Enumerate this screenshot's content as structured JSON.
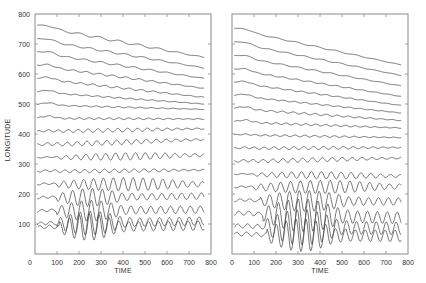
{
  "chart_data": [
    {
      "type": "line",
      "panel": "left",
      "title": "",
      "xlabel": "TIME",
      "ylabel": "LONGITUDE",
      "xlim": [
        0,
        800
      ],
      "ylim": [
        0,
        800
      ],
      "xticks": [
        0,
        100,
        200,
        300,
        400,
        500,
        600,
        700,
        800
      ],
      "yticks": [
        100,
        200,
        300,
        400,
        500,
        600,
        700,
        800
      ],
      "grid": false,
      "legend": null,
      "series_description": "17 stacked longitude traces vs time; traces drift downward over time; oscillation amplitude increases at lower longitudes",
      "series": [
        {
          "name": "trace-1",
          "start_lon": 760,
          "end_lon": 655,
          "amp": 4,
          "period": 90,
          "packet": [
            0,
            800
          ]
        },
        {
          "name": "trace-2",
          "start_lon": 715,
          "end_lon": 620,
          "amp": 3,
          "period": 80,
          "packet": [
            0,
            800
          ]
        },
        {
          "name": "trace-3",
          "start_lon": 672,
          "end_lon": 585,
          "amp": 3,
          "period": 75,
          "packet": [
            0,
            800
          ]
        },
        {
          "name": "trace-4",
          "start_lon": 628,
          "end_lon": 552,
          "amp": 3,
          "period": 60,
          "packet": [
            0,
            800
          ]
        },
        {
          "name": "trace-5",
          "start_lon": 585,
          "end_lon": 522,
          "amp": 3,
          "period": 55,
          "packet": [
            0,
            800
          ]
        },
        {
          "name": "trace-6",
          "start_lon": 540,
          "end_lon": 500,
          "amp": 2,
          "period": 50,
          "packet": [
            0,
            800
          ]
        },
        {
          "name": "trace-7",
          "start_lon": 497,
          "end_lon": 482,
          "amp": 2,
          "period": 50,
          "packet": [
            0,
            800
          ]
        },
        {
          "name": "trace-8",
          "start_lon": 452,
          "end_lon": 450,
          "amp": 3,
          "period": 45,
          "packet": [
            0,
            800
          ]
        },
        {
          "name": "trace-9",
          "start_lon": 408,
          "end_lon": 418,
          "amp": 6,
          "period": 45,
          "packet": [
            0,
            800
          ]
        },
        {
          "name": "trace-10",
          "start_lon": 363,
          "end_lon": 382,
          "amp": 8,
          "period": 45,
          "packet": [
            0,
            800
          ]
        },
        {
          "name": "trace-11",
          "start_lon": 320,
          "end_lon": 330,
          "amp": 12,
          "period": 45,
          "packet": [
            100,
            800
          ]
        },
        {
          "name": "trace-12",
          "start_lon": 275,
          "end_lon": 280,
          "amp": 6,
          "period": 45,
          "packet": [
            0,
            800
          ]
        },
        {
          "name": "trace-13",
          "start_lon": 232,
          "end_lon": 233,
          "amp": 22,
          "period": 45,
          "packet": [
            100,
            800
          ]
        },
        {
          "name": "trace-14",
          "start_lon": 187,
          "end_lon": 193,
          "amp": 30,
          "period": 45,
          "packet": [
            100,
            450
          ]
        },
        {
          "name": "trace-15",
          "start_lon": 143,
          "end_lon": 148,
          "amp": 35,
          "period": 45,
          "packet": [
            100,
            450
          ]
        },
        {
          "name": "trace-16",
          "start_lon": 100,
          "end_lon": 110,
          "amp": 40,
          "period": 45,
          "packet": [
            100,
            450
          ]
        },
        {
          "name": "trace-17",
          "start_lon": 88,
          "end_lon": 95,
          "amp": 45,
          "period": 45,
          "packet": [
            110,
            420
          ]
        }
      ]
    },
    {
      "type": "line",
      "panel": "right",
      "title": "",
      "xlabel": "TIME",
      "ylabel": "",
      "xlim": [
        0,
        800
      ],
      "ylim": [
        0,
        800
      ],
      "xticks": [
        0,
        100,
        200,
        300,
        400,
        500,
        600,
        700,
        800
      ],
      "yticks": [],
      "grid": false,
      "legend": null,
      "series_description": "17 stacked longitude traces vs time; large-amplitude wave packet between time ~150 and ~550 at low longitudes",
      "series": [
        {
          "name": "trace-1",
          "start_lon": 750,
          "end_lon": 630,
          "amp": 2,
          "period": 90,
          "packet": [
            0,
            800
          ]
        },
        {
          "name": "trace-2",
          "start_lon": 705,
          "end_lon": 595,
          "amp": 2,
          "period": 80,
          "packet": [
            0,
            800
          ]
        },
        {
          "name": "trace-3",
          "start_lon": 660,
          "end_lon": 560,
          "amp": 2,
          "period": 75,
          "packet": [
            0,
            800
          ]
        },
        {
          "name": "trace-4",
          "start_lon": 615,
          "end_lon": 525,
          "amp": 2,
          "period": 60,
          "packet": [
            0,
            800
          ]
        },
        {
          "name": "trace-5",
          "start_lon": 572,
          "end_lon": 495,
          "amp": 2,
          "period": 55,
          "packet": [
            0,
            800
          ]
        },
        {
          "name": "trace-6",
          "start_lon": 528,
          "end_lon": 470,
          "amp": 2,
          "period": 50,
          "packet": [
            0,
            800
          ]
        },
        {
          "name": "trace-7",
          "start_lon": 485,
          "end_lon": 445,
          "amp": 3,
          "period": 50,
          "packet": [
            0,
            800
          ]
        },
        {
          "name": "trace-8",
          "start_lon": 440,
          "end_lon": 420,
          "amp": 3,
          "period": 45,
          "packet": [
            0,
            800
          ]
        },
        {
          "name": "trace-9",
          "start_lon": 397,
          "end_lon": 388,
          "amp": 3,
          "period": 45,
          "packet": [
            0,
            800
          ]
        },
        {
          "name": "trace-10",
          "start_lon": 352,
          "end_lon": 355,
          "amp": 5,
          "period": 45,
          "packet": [
            0,
            800
          ]
        },
        {
          "name": "trace-11",
          "start_lon": 308,
          "end_lon": 320,
          "amp": 7,
          "period": 45,
          "packet": [
            0,
            800
          ]
        },
        {
          "name": "trace-12",
          "start_lon": 265,
          "end_lon": 260,
          "amp": 12,
          "period": 45,
          "packet": [
            100,
            800
          ]
        },
        {
          "name": "trace-13",
          "start_lon": 222,
          "end_lon": 225,
          "amp": 22,
          "period": 45,
          "packet": [
            100,
            800
          ]
        },
        {
          "name": "trace-14",
          "start_lon": 178,
          "end_lon": 175,
          "amp": 35,
          "period": 45,
          "packet": [
            130,
            600
          ]
        },
        {
          "name": "trace-15",
          "start_lon": 135,
          "end_lon": 120,
          "amp": 55,
          "period": 45,
          "packet": [
            140,
            560
          ]
        },
        {
          "name": "trace-16",
          "start_lon": 92,
          "end_lon": 85,
          "amp": 60,
          "period": 45,
          "packet": [
            150,
            540
          ]
        },
        {
          "name": "trace-17",
          "start_lon": 65,
          "end_lon": 60,
          "amp": 55,
          "period": 45,
          "packet": [
            160,
            520
          ]
        }
      ]
    }
  ],
  "figure": {
    "ylabel": "LONGITUDE",
    "left_xlabel": "TIME",
    "right_xlabel": "TIME",
    "left_ytick_labels": [
      "800",
      "700",
      "600",
      "500",
      "400",
      "300",
      "200",
      "100"
    ],
    "left_xtick_labels": [
      "0",
      "100",
      "200",
      "300",
      "400",
      "500",
      "600",
      "700",
      "800"
    ],
    "right_xtick_labels": [
      "0",
      "100",
      "200",
      "300",
      "400",
      "500",
      "600",
      "700",
      "800"
    ]
  }
}
